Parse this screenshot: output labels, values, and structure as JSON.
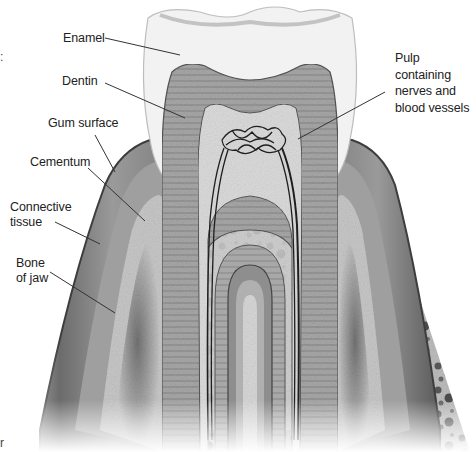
{
  "diagram": {
    "labels": {
      "enamel": "Enamel",
      "dentin": "Dentin",
      "gum_surface": "Gum surface",
      "cementum": "Cementum",
      "connective_tissue_1": "Connective",
      "connective_tissue_2": "tissue",
      "bone_of_jaw_1": "Bone",
      "bone_of_jaw_2": "of jaw",
      "pulp_1": "Pulp",
      "pulp_2": "containing",
      "pulp_3": "nerves and",
      "pulp_4": "blood vessels"
    },
    "edge_fragments": {
      "top_left": ":",
      "bottom_left": "r"
    },
    "colors": {
      "enamel": "#f1f1f1",
      "dentin": "#9a9a9a",
      "pulp": "#d8d8d8",
      "gum": "#8a8a8a",
      "gum_dark": "#4a4a4a",
      "bone": "#b8b8b8",
      "bone_spots": "#555555",
      "leader_line": "#333333",
      "text": "#222222"
    }
  }
}
